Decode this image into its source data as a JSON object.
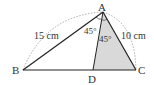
{
  "diagram": {
    "type": "triangle-angle-bisector",
    "points": {
      "A": {
        "label": "A",
        "x": 103,
        "y": 12
      },
      "B": {
        "label": "B",
        "x": 23,
        "y": 70
      },
      "C": {
        "label": "C",
        "x": 136,
        "y": 70
      },
      "D": {
        "label": "D",
        "x": 93,
        "y": 70
      }
    },
    "lengths": {
      "AB": "15 cm",
      "AC": "10 cm"
    },
    "angles": {
      "BAD": "45°",
      "DAC": "45°"
    },
    "shaded_region": "ADC",
    "colors": {
      "line": "#222222",
      "shade": "#d9d9d9",
      "dashed": "#888888"
    }
  }
}
